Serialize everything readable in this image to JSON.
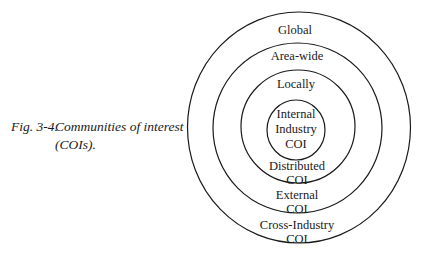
{
  "caption": {
    "figure_number": "Fig. 3-4.",
    "title_line1": "Communities of interest",
    "title_line2": "(COIs)."
  },
  "diagram": {
    "type": "concentric-circles",
    "rings": [
      {
        "scope": "Global",
        "label_lines": [
          "Cross-Industry",
          "COI"
        ]
      },
      {
        "scope": "Area-wide",
        "label_lines": [
          "External",
          "COI"
        ]
      },
      {
        "scope": "Locally",
        "label_lines": [
          "Distributed",
          "COI"
        ]
      },
      {
        "scope": "",
        "label_lines": [
          "Internal",
          "Industry",
          "COI"
        ]
      }
    ]
  },
  "labels": {
    "global": "Global",
    "area_wide": "Area-wide",
    "locally": "Locally",
    "internal": "Internal",
    "industry": "Industry",
    "inner_coi": "COI",
    "distributed": "Distributed",
    "distributed_coi": "COI",
    "external": "External",
    "external_coi": "COI",
    "cross_industry": "Cross-Industry",
    "cross_industry_coi": "COI"
  }
}
